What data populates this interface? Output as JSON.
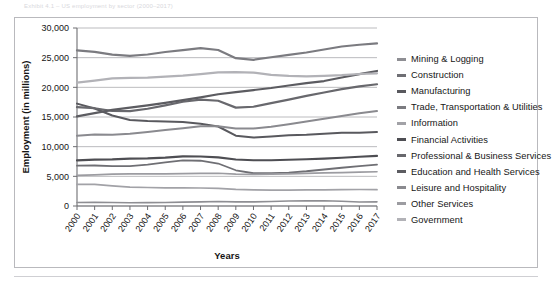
{
  "caption": "Exhibit  4.1 – US employment by sector (2000–2017)",
  "axes": {
    "ylabel": "Employment (in millions)",
    "xlabel": "Years",
    "yticks": [
      "0",
      "5,000",
      "10,000",
      "15,000",
      "20,000",
      "25,000",
      "30,000"
    ]
  },
  "colors": {
    "panel_border": "#b9b9bd",
    "gridline": "#a9a9ad",
    "axis": "#6e6e72",
    "text": "#161616"
  },
  "chart_data": {
    "type": "line",
    "title": "",
    "xlabel": "Years",
    "ylabel": "Employment (in millions)",
    "ylim": [
      0,
      30000
    ],
    "ytick_step": 5000,
    "grid": true,
    "legend_position": "right",
    "x": [
      "2000",
      "2001",
      "2002",
      "2003",
      "2004",
      "2005",
      "2006",
      "2007",
      "2008",
      "2009",
      "2010",
      "2011",
      "2012",
      "2013",
      "2014",
      "2015",
      "2016",
      "2017"
    ],
    "series": [
      {
        "name": "Mining & Logging",
        "color": "#8e8e93",
        "width": 1.6,
        "values": [
          600,
          610,
          580,
          560,
          570,
          600,
          650,
          700,
          760,
          700,
          690,
          760,
          840,
          860,
          890,
          790,
          670,
          700
        ]
      },
      {
        "name": "Construction",
        "color": "#6f6f74",
        "width": 1.8,
        "values": [
          6790,
          6830,
          6720,
          6730,
          6960,
          7340,
          7690,
          7630,
          7160,
          6020,
          5520,
          5530,
          5640,
          5860,
          6150,
          6450,
          6730,
          6970
        ]
      },
      {
        "name": "Manufacturing",
        "color": "#59595e",
        "width": 2.0,
        "values": [
          17260,
          16440,
          15260,
          14510,
          14320,
          14230,
          14150,
          13880,
          13400,
          11850,
          11530,
          11730,
          11930,
          12020,
          12180,
          12330,
          12340,
          12470
        ]
      },
      {
        "name": "Trade, Transportation & Utilities",
        "color": "#7b7b80",
        "width": 2.2,
        "values": [
          26230,
          25980,
          25500,
          25290,
          25530,
          25960,
          26280,
          26610,
          26290,
          24910,
          24640,
          25070,
          25480,
          25870,
          26380,
          26880,
          27180,
          27400
        ]
      },
      {
        "name": "Information",
        "color": "#a2a2a7",
        "width": 1.7,
        "values": [
          3630,
          3630,
          3400,
          3190,
          3120,
          3060,
          3040,
          3030,
          2980,
          2800,
          2710,
          2690,
          2680,
          2710,
          2730,
          2750,
          2780,
          2760
        ]
      },
      {
        "name": "Financial Activities",
        "color": "#4e4e53",
        "width": 2.1,
        "values": [
          7690,
          7810,
          7850,
          7980,
          8030,
          8150,
          8360,
          8350,
          8200,
          7840,
          7700,
          7700,
          7790,
          7890,
          7980,
          8120,
          8290,
          8450
        ]
      },
      {
        "name": "Professional & Business Services",
        "color": "#68686d",
        "width": 2.2,
        "values": [
          16670,
          16480,
          16010,
          15990,
          16390,
          16950,
          17570,
          17940,
          17740,
          16580,
          16730,
          17330,
          17930,
          18560,
          19130,
          19690,
          20150,
          20520
        ]
      },
      {
        "name": "Education and Health Services",
        "color": "#5c5c61",
        "width": 2.2,
        "values": [
          15110,
          15640,
          16200,
          16590,
          16950,
          17370,
          17830,
          18320,
          18840,
          19190,
          19540,
          19890,
          20310,
          20700,
          21060,
          21660,
          22230,
          22760
        ]
      },
      {
        "name": "Leisure and Hospitality",
        "color": "#8a8a8f",
        "width": 2.0,
        "values": [
          11860,
          12030,
          11990,
          12170,
          12490,
          12810,
          13110,
          13430,
          13440,
          13080,
          13050,
          13350,
          13770,
          14250,
          14700,
          15160,
          15620,
          16000
        ]
      },
      {
        "name": "Other Services",
        "color": "#9c9ca1",
        "width": 1.7,
        "values": [
          5170,
          5260,
          5370,
          5400,
          5410,
          5400,
          5440,
          5490,
          5520,
          5370,
          5330,
          5360,
          5430,
          5490,
          5570,
          5630,
          5700,
          5770
        ]
      },
      {
        "name": "Government",
        "color": "#b2b2b7",
        "width": 2.2,
        "values": [
          20790,
          21120,
          21510,
          21580,
          21620,
          21800,
          21970,
          22220,
          22510,
          22550,
          22490,
          22090,
          21920,
          21850,
          21940,
          22050,
          22250,
          22360
        ]
      }
    ]
  }
}
